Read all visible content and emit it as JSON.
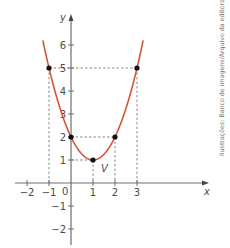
{
  "chart_data": {
    "type": "line",
    "title": "",
    "function": "y = x^2 - 2x + 2",
    "xlabel": "x",
    "ylabel": "y",
    "xlim": [
      -2.5,
      6.3
    ],
    "ylim": [
      -2.3,
      7.2
    ],
    "x_ticks": [
      -2,
      -1,
      0,
      1,
      2,
      3
    ],
    "x_tick_labels": [
      "−2",
      "−1",
      "0",
      "1",
      "2",
      "3"
    ],
    "y_ticks": [
      -2,
      -1,
      1,
      2,
      3,
      4,
      5,
      6
    ],
    "y_tick_labels": [
      "−2",
      "−1",
      "1",
      "2",
      "3",
      "4",
      "5",
      "6"
    ],
    "grid": false,
    "series": [
      {
        "name": "parabola",
        "color": "#d2553a",
        "x": [
          -1.28,
          -1,
          -0.5,
          0,
          0.5,
          1,
          1.5,
          2,
          2.5,
          3,
          3.28
        ],
        "y": [
          5.6,
          5,
          3.25,
          2,
          1.25,
          1,
          1.25,
          2,
          3.25,
          5,
          5.6
        ]
      }
    ],
    "highlighted_points": [
      {
        "x": -1,
        "y": 5
      },
      {
        "x": 0,
        "y": 2
      },
      {
        "x": 1,
        "y": 1,
        "label": "V"
      },
      {
        "x": 2,
        "y": 2
      },
      {
        "x": 3,
        "y": 5
      }
    ],
    "guide_lines": "dashed",
    "vertex_label": "V",
    "origin_label": "0"
  },
  "credit": "Ilustrações: Banco de imagens/Arquivo da editora",
  "colors": {
    "curve": "#d2553a",
    "axis": "#6e6e6e",
    "point": "#111111",
    "dashed": "#8a8a8a"
  }
}
